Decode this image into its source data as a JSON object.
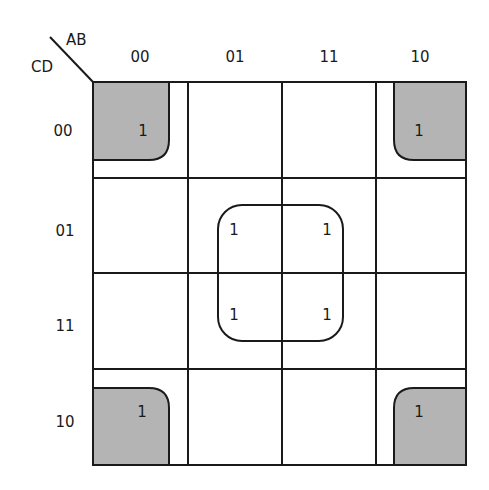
{
  "diagram": {
    "type": "karnaugh-map",
    "row_variable_label": "CD",
    "column_variable_label": "AB",
    "column_headers": [
      "00",
      "01",
      "11",
      "10"
    ],
    "row_headers": [
      "00",
      "01",
      "11",
      "10"
    ],
    "cells": [
      [
        "1",
        "",
        "",
        "1"
      ],
      [
        "",
        "1",
        "1",
        ""
      ],
      [
        "",
        "1",
        "1",
        ""
      ],
      [
        "1",
        "",
        "",
        "1"
      ]
    ],
    "groups": [
      {
        "name": "center-quad",
        "cells": [
          [
            1,
            1
          ],
          [
            1,
            2
          ],
          [
            2,
            1
          ],
          [
            2,
            2
          ]
        ],
        "shaded": false
      },
      {
        "name": "corner-quad",
        "cells": [
          [
            0,
            0
          ],
          [
            0,
            3
          ],
          [
            3,
            0
          ],
          [
            3,
            3
          ]
        ],
        "shaded": true
      }
    ],
    "colors": {
      "line": "#1a1a1a",
      "shade": "#b4b4b4",
      "background": "#ffffff"
    }
  }
}
